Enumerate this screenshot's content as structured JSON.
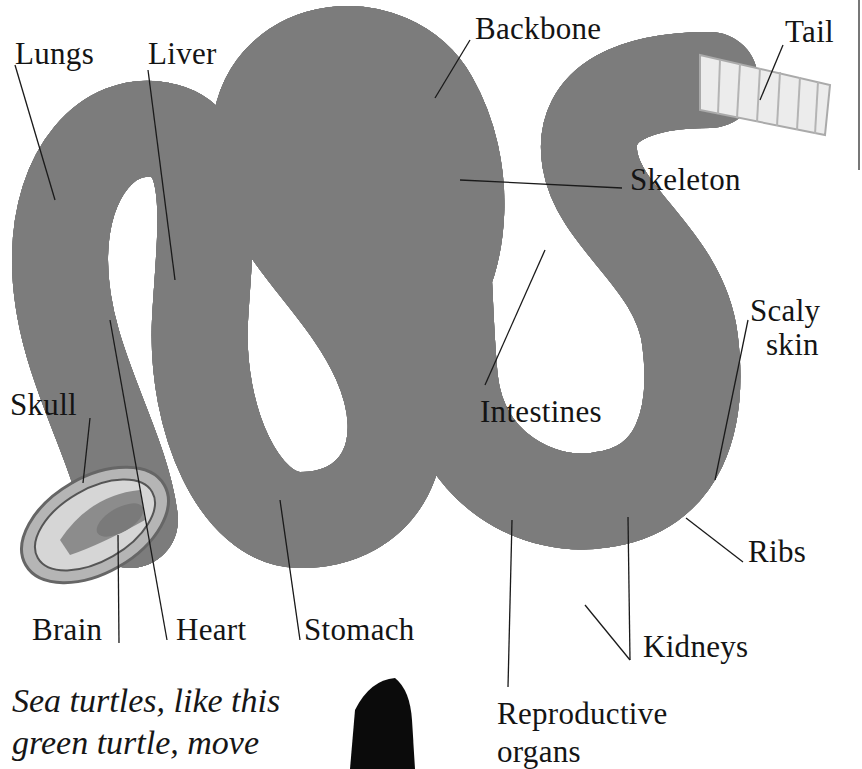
{
  "diagram": {
    "labels": {
      "lungs": "Lungs",
      "liver": "Liver",
      "backbone": "Backbone",
      "tail": "Tail",
      "skeleton": "Skeleton",
      "scaly_skin_1": "Scaly",
      "scaly_skin_2": "skin",
      "intestines": "Intestines",
      "skull": "Skull",
      "ribs": "Ribs",
      "brain": "Brain",
      "heart": "Heart",
      "stomach": "Stomach",
      "kidneys": "Kidneys",
      "reproductive_1": "Reproductive",
      "reproductive_2": "organs"
    },
    "colors": {
      "body_dark": "#6e6e6e",
      "body_mid": "#9a9a9a",
      "body_light": "#c8c8c8",
      "bone": "#e6e6e6",
      "outline": "#3a3a3a",
      "leader": "#1a1a1a"
    }
  },
  "caption": {
    "line1": "Sea turtles, like this",
    "line2": "green turtle, move"
  }
}
